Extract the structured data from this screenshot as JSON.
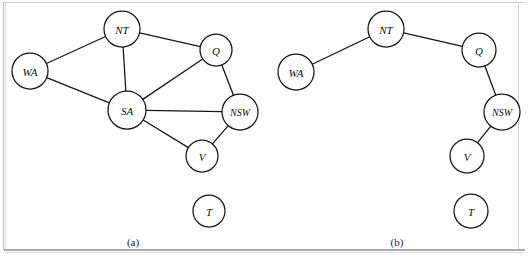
{
  "figure": {
    "background_color": "#ffffff",
    "stroke_color": "#161616",
    "panels": [
      {
        "id": "panel-a",
        "caption": "(a)",
        "caption_x": 133,
        "caption_y": 242,
        "nodes": [
          {
            "id": "WA",
            "label": "WA",
            "cx": 30,
            "cy": 71,
            "r": 18,
            "font_size": 11
          },
          {
            "id": "NT",
            "label": "NT",
            "cx": 122,
            "cy": 29,
            "r": 18,
            "font_size": 11
          },
          {
            "id": "Q",
            "label": "Q",
            "cx": 216,
            "cy": 50,
            "r": 16,
            "font_size": 11
          },
          {
            "id": "SA",
            "label": "SA",
            "cx": 127,
            "cy": 110,
            "r": 19,
            "font_size": 11
          },
          {
            "id": "NSW",
            "label": "NSW",
            "cx": 240,
            "cy": 112,
            "r": 18,
            "font_size": 10
          },
          {
            "id": "V",
            "label": "V",
            "cx": 202,
            "cy": 156,
            "r": 16,
            "font_size": 11
          },
          {
            "id": "T",
            "label": "T",
            "cx": 209,
            "cy": 211,
            "r": 16,
            "font_size": 11
          }
        ],
        "edges": [
          {
            "from": "WA",
            "to": "NT"
          },
          {
            "from": "WA",
            "to": "SA"
          },
          {
            "from": "NT",
            "to": "Q"
          },
          {
            "from": "NT",
            "to": "SA"
          },
          {
            "from": "SA",
            "to": "Q"
          },
          {
            "from": "SA",
            "to": "NSW"
          },
          {
            "from": "SA",
            "to": "V"
          },
          {
            "from": "Q",
            "to": "NSW"
          },
          {
            "from": "NSW",
            "to": "V"
          }
        ]
      },
      {
        "id": "panel-b",
        "caption": "(b)",
        "caption_x": 397,
        "caption_y": 242,
        "nodes": [
          {
            "id": "WA",
            "label": "WA",
            "cx": 296,
            "cy": 72,
            "r": 18,
            "font_size": 11
          },
          {
            "id": "NT",
            "label": "NT",
            "cx": 386,
            "cy": 29,
            "r": 18,
            "font_size": 11
          },
          {
            "id": "Q",
            "label": "Q",
            "cx": 479,
            "cy": 50,
            "r": 17,
            "font_size": 11
          },
          {
            "id": "NSW",
            "label": "NSW",
            "cx": 502,
            "cy": 112,
            "r": 18,
            "font_size": 10
          },
          {
            "id": "V",
            "label": "V",
            "cx": 467,
            "cy": 156,
            "r": 17,
            "font_size": 11
          },
          {
            "id": "T",
            "label": "T",
            "cx": 471,
            "cy": 211,
            "r": 17,
            "font_size": 11
          }
        ],
        "edges": [
          {
            "from": "WA",
            "to": "NT"
          },
          {
            "from": "NT",
            "to": "Q"
          },
          {
            "from": "Q",
            "to": "NSW"
          },
          {
            "from": "NSW",
            "to": "V"
          }
        ]
      }
    ]
  }
}
